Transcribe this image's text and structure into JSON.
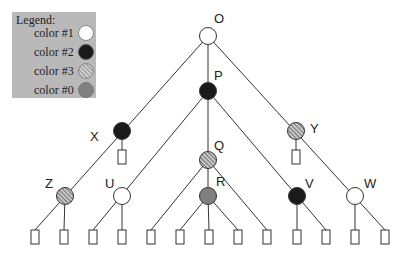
{
  "legend": {
    "title": "Legend:",
    "items": [
      {
        "label": "color #1",
        "fill": "white"
      },
      {
        "label": "color #2",
        "fill": "black"
      },
      {
        "label": "color #3",
        "fill": "hatched"
      },
      {
        "label": "color #0",
        "fill": "gray"
      }
    ]
  },
  "colors": {
    "white": "#ffffff",
    "black": "#1a1a1a",
    "gray": "#808080",
    "hatch_bg": "#c8c8c8",
    "hatch_line": "#444444",
    "legend_bg": "#b9b9b9",
    "line": "#333333"
  },
  "nodes": [
    {
      "id": "O",
      "label": "O",
      "color": "color #1",
      "x": 208,
      "y": 36
    },
    {
      "id": "P",
      "label": "P",
      "color": "color #2",
      "x": 208,
      "y": 91
    },
    {
      "id": "X",
      "label": "X",
      "color": "color #2",
      "x": 122,
      "y": 131
    },
    {
      "id": "Y",
      "label": "Y",
      "color": "color #3",
      "x": 296,
      "y": 131
    },
    {
      "id": "Q",
      "label": "Q",
      "color": "color #3",
      "x": 208,
      "y": 160
    },
    {
      "id": "Z",
      "label": "Z",
      "color": "color #3",
      "x": 65,
      "y": 196
    },
    {
      "id": "U",
      "label": "U",
      "color": "color #1",
      "x": 122,
      "y": 196
    },
    {
      "id": "R",
      "label": "R",
      "color": "color #0",
      "x": 208,
      "y": 196
    },
    {
      "id": "V",
      "label": "V",
      "color": "color #2",
      "x": 297,
      "y": 196
    },
    {
      "id": "W",
      "label": "W",
      "color": "color #1",
      "x": 355,
      "y": 196
    }
  ],
  "leaf_count": 15
}
